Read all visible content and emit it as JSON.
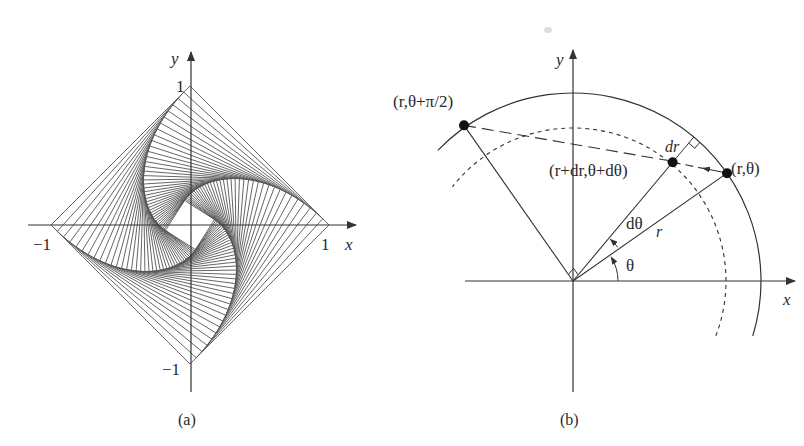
{
  "figure": {
    "background": "#ffffff",
    "line_color": "#555555",
    "axis_color": "#333333",
    "smudge": {
      "x": 548,
      "y": 30
    }
  },
  "panel_a": {
    "caption": "(a)",
    "axis_x_label": "x",
    "axis_y_label": "y",
    "tick_labels": {
      "x_pos": "1",
      "x_neg": "−1",
      "y_pos": "1",
      "y_neg": "−1"
    },
    "origin": {
      "x": 190,
      "y": 225
    },
    "scale": 139,
    "description": "Four-bug pursuit problem: bugs start at square corners (1,0),(0,1),(-1,0),(0,-1), each chasing the next; chords show successive pursuit lines spiralling inward",
    "square_vertices": [
      [
        1,
        0
      ],
      [
        0,
        1
      ],
      [
        -1,
        0
      ],
      [
        0,
        -1
      ]
    ],
    "pursuit_steps": 60,
    "step_fraction": 0.045
  },
  "panel_b": {
    "caption": "(b)",
    "axis_x_label": "x",
    "axis_y_label": "y",
    "origin": {
      "x": 573,
      "y": 281
    },
    "outer_radius": 188,
    "inner_radius": 153,
    "points": [
      {
        "label": "(r,θ)",
        "angle_deg": 35,
        "radius": 188
      },
      {
        "label": "(r,θ+π/2)",
        "angle_deg": 125,
        "radius": 190
      },
      {
        "label": "(r+dr,θ+dθ)",
        "angle_deg": 50,
        "radius": 155
      }
    ],
    "labels": {
      "theta": "θ",
      "dtheta": "dθ",
      "r": "r",
      "dr": "dr",
      "point_r_theta": "(r,θ)",
      "point_r_theta_pi2": "(r,θ+π/2)",
      "point_r_dr": "(r+dr,θ+dθ)"
    }
  }
}
